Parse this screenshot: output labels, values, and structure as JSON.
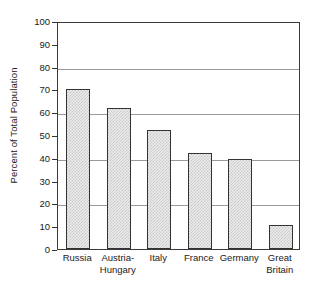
{
  "chart_data": {
    "type": "bar",
    "title": "",
    "subtitle": "",
    "xlabel": "",
    "ylabel": "Percent of Total Population",
    "categories": [
      "Russia",
      "Austria-Hungary",
      "Italy",
      "France",
      "Germany",
      "Great Britain"
    ],
    "category_label_lines": [
      [
        "Russia"
      ],
      [
        "Austria-",
        "Hungary"
      ],
      [
        "Italy"
      ],
      [
        "France"
      ],
      [
        "Germany"
      ],
      [
        "Great",
        "Britain"
      ]
    ],
    "values": [
      70,
      62,
      52,
      42,
      39.5,
      10.5
    ],
    "ylim": [
      0,
      100
    ],
    "xlim_categories": 6,
    "y_ticks": [
      0,
      10,
      20,
      30,
      40,
      50,
      60,
      70,
      80,
      90,
      100
    ],
    "y_tick_labels": [
      "0",
      "10",
      "20",
      "30",
      "40",
      "50",
      "60",
      "70",
      "80",
      "90",
      "100"
    ],
    "gridlines_y": [
      20,
      40,
      60,
      80
    ],
    "grid": true,
    "legend": null,
    "legend_position": "none",
    "annotations": [],
    "colors": {
      "bar_fill": "#ececec",
      "bar_hatch": "#c9c9c9",
      "bar_border": "#333333",
      "gridline": "#9a9a9a",
      "axis_frame": "#3a3a3a",
      "text": "#1a1a1a",
      "background": "#ffffff"
    }
  }
}
